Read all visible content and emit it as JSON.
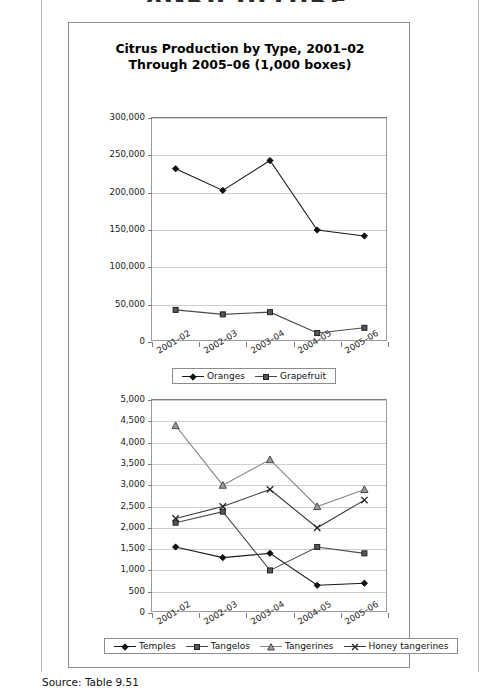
{
  "page": {
    "running_head": "AGRICULTURE",
    "source_note": "Source: Table 9.51"
  },
  "figure": {
    "title_line1": "Citrus Production by Type, 2001–02",
    "title_line2": "Through 2005–06 (1,000 boxes)"
  },
  "chart_data": [
    {
      "type": "line",
      "title": "Citrus Production by Type, 2001–02 Through 2005–06 (1,000 boxes)",
      "xlabel": "",
      "ylabel": "",
      "categories": [
        "2001–02",
        "2002–03",
        "2003–04",
        "2004–05",
        "2005–06"
      ],
      "ylim": [
        0,
        300000
      ],
      "yticks": [
        0,
        50000,
        100000,
        150000,
        200000,
        250000,
        300000
      ],
      "ytick_labels": [
        "0",
        "50,000",
        "100,000",
        "150,000",
        "200,000",
        "250,000",
        "300,000"
      ],
      "grid": true,
      "legend_position": "bottom",
      "series": [
        {
          "name": "Oranges",
          "marker": "diamond",
          "color": "#1a1a1a",
          "values": [
            232000,
            203000,
            243000,
            150000,
            142000
          ]
        },
        {
          "name": "Grapefruit",
          "marker": "square",
          "color": "#4a4a4a",
          "values": [
            43000,
            37000,
            40000,
            12000,
            19000
          ]
        }
      ]
    },
    {
      "type": "line",
      "title": "",
      "xlabel": "",
      "ylabel": "",
      "categories": [
        "2001–02",
        "2002–03",
        "2003–04",
        "2004–05",
        "2005–06"
      ],
      "ylim": [
        0,
        5000
      ],
      "yticks": [
        0,
        500,
        1000,
        1500,
        2000,
        2500,
        3000,
        3500,
        4000,
        4500,
        5000
      ],
      "ytick_labels": [
        "0",
        "500",
        "1,000",
        "1,500",
        "2,000",
        "2,500",
        "3,000",
        "3,500",
        "4,000",
        "4,500",
        "5,000"
      ],
      "grid": true,
      "legend_position": "bottom",
      "series": [
        {
          "name": "Temples",
          "marker": "diamond",
          "color": "#1a1a1a",
          "values": [
            1550,
            1300,
            1400,
            650,
            700
          ]
        },
        {
          "name": "Tangelos",
          "marker": "square",
          "color": "#4a4a4a",
          "values": [
            2120,
            2380,
            1000,
            1550,
            1400
          ]
        },
        {
          "name": "Tangerines",
          "marker": "triangle",
          "color": "#8a8a8a",
          "values": [
            4400,
            3000,
            3600,
            2500,
            2900
          ]
        },
        {
          "name": "Honey tangerines",
          "marker": "x",
          "color": "#3a3a3a",
          "values": [
            2220,
            2500,
            2900,
            2000,
            2650
          ]
        }
      ]
    }
  ]
}
